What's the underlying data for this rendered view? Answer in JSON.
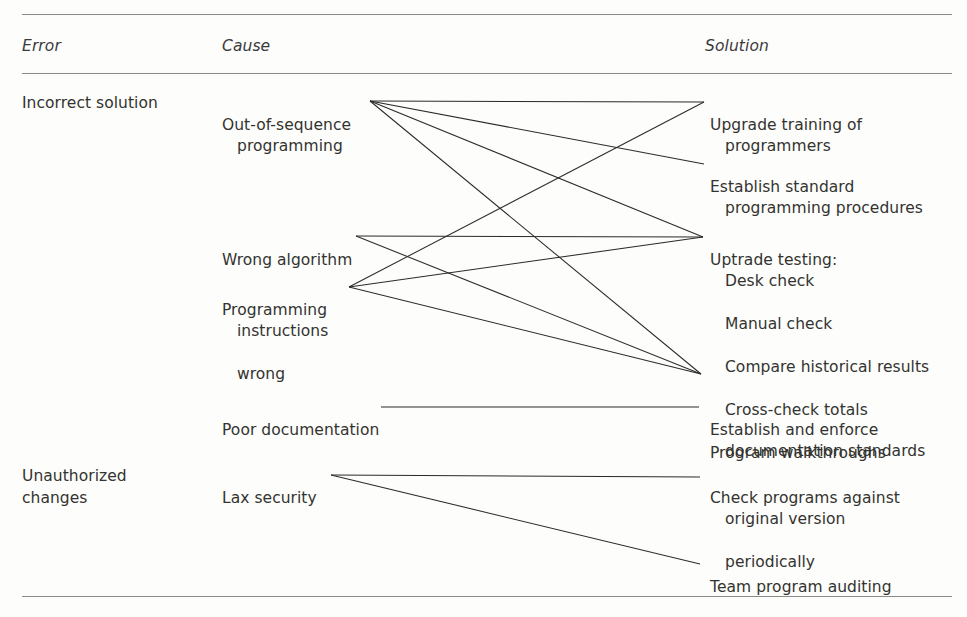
{
  "table": {
    "headers": {
      "error": "Error",
      "cause": "Cause",
      "solution": "Solution"
    },
    "errors": [
      {
        "id": "incorrect-solution",
        "label": "Incorrect solution"
      },
      {
        "id": "unauthorized-changes",
        "label": "Unauthorized\nchanges"
      }
    ],
    "causes": [
      {
        "id": "out-of-sequence",
        "line1": "Out-of-sequence",
        "line2": "programming"
      },
      {
        "id": "wrong-algorithm",
        "line1": "Wrong algorithm",
        "line2": ""
      },
      {
        "id": "programming-instructions-wrong",
        "line1": "Programming",
        "line2": "instructions",
        "line3": "wrong"
      },
      {
        "id": "poor-documentation",
        "line1": "Poor documentation",
        "line2": ""
      },
      {
        "id": "lax-security",
        "line1": "Lax security",
        "line2": ""
      }
    ],
    "solutions": [
      {
        "id": "upgrade-training",
        "line1": "Upgrade training of",
        "line2": "programmers"
      },
      {
        "id": "establish-standard",
        "line1": "Establish standard",
        "line2": "programming procedures"
      },
      {
        "id": "uptrade-testing",
        "line1": "Uptrade testing:",
        "sub": [
          "Desk check",
          "Manual check",
          "Compare historical results",
          "Cross-check totals",
          "Program walkthroughs"
        ]
      },
      {
        "id": "establish-enforce-documentation",
        "line1": "Establish and enforce",
        "line2": "documentation standards"
      },
      {
        "id": "check-programs",
        "line1": "Check programs against",
        "line2": "original version",
        "line3": "periodically"
      },
      {
        "id": "team-program-auditing",
        "line1": "Team program auditing",
        "line2": ""
      }
    ],
    "links": [
      {
        "from": "out-of-sequence",
        "to": "upgrade-training"
      },
      {
        "from": "out-of-sequence",
        "to": "establish-standard"
      },
      {
        "from": "out-of-sequence",
        "to": "uptrade-testing"
      },
      {
        "from": "out-of-sequence",
        "to": "program-walkthroughs"
      },
      {
        "from": "wrong-algorithm",
        "to": "uptrade-testing"
      },
      {
        "from": "wrong-algorithm",
        "to": "program-walkthroughs"
      },
      {
        "from": "programming-instructions-wrong",
        "to": "upgrade-training"
      },
      {
        "from": "programming-instructions-wrong",
        "to": "uptrade-testing"
      },
      {
        "from": "programming-instructions-wrong",
        "to": "program-walkthroughs"
      },
      {
        "from": "poor-documentation",
        "to": "establish-enforce-documentation"
      },
      {
        "from": "lax-security",
        "to": "check-programs"
      },
      {
        "from": "lax-security",
        "to": "team-program-auditing"
      }
    ]
  },
  "colors": {
    "rule": "#8a8a86",
    "text": "#33332f",
    "link": "#2b2b2b",
    "background": "#fdfdfc"
  }
}
